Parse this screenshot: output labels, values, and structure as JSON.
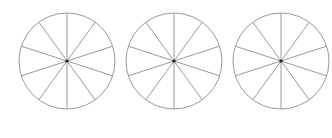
{
  "diagram": {
    "type": "fraction-circles",
    "width": 332,
    "height": 138,
    "stroke_color": "#9a9a9a",
    "center_dot_color": "#222222",
    "circles": [
      {
        "id": "circle-1",
        "cx": 67,
        "cy": 61,
        "r": 48,
        "sectors": 10,
        "shaded": 0
      },
      {
        "id": "circle-2",
        "cx": 174,
        "cy": 61,
        "r": 48,
        "sectors": 10,
        "shaded": 0
      },
      {
        "id": "circle-3",
        "cx": 281,
        "cy": 61,
        "r": 48,
        "sectors": 10,
        "shaded": 0
      }
    ],
    "start_angle_deg": -90
  }
}
